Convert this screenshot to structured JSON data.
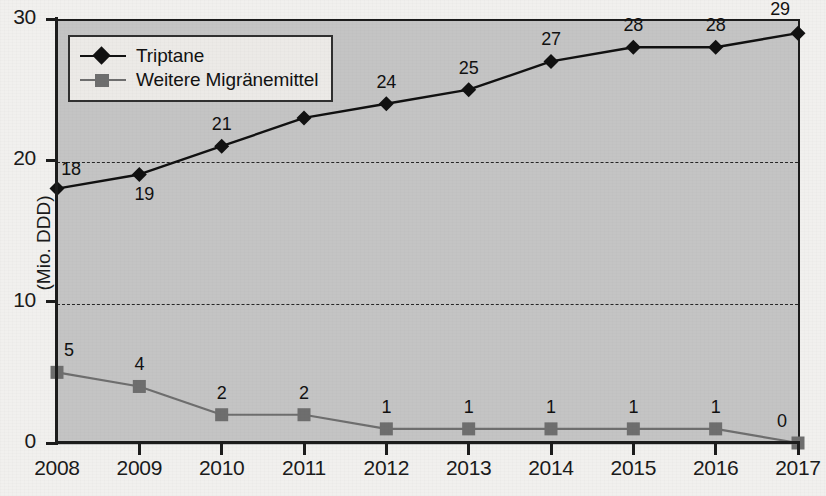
{
  "chart_data": {
    "type": "line",
    "title": "",
    "xlabel": "",
    "ylabel": "(Mio. DDD)",
    "categories": [
      "2008",
      "2009",
      "2010",
      "2011",
      "2012",
      "2013",
      "2014",
      "2015",
      "2016",
      "2017"
    ],
    "ylim": [
      0,
      30
    ],
    "yticks": [
      0,
      10,
      20,
      30
    ],
    "ytick_labels": [
      "0",
      "10",
      "20",
      "30"
    ],
    "grid": "horizontal-dashed-at-10-and-20",
    "legend_position": "top-left-inside",
    "series": [
      {
        "name": "Triptane",
        "marker": "diamond",
        "color": "#111111",
        "values": [
          18,
          19,
          21,
          23,
          24,
          25,
          27,
          28,
          28,
          29
        ],
        "labels": [
          "18",
          "19",
          "21",
          "23",
          "24",
          "25",
          "27",
          "28",
          "28",
          "29"
        ]
      },
      {
        "name": "Weitere Migränemittel",
        "marker": "square",
        "color": "#6e6e6e",
        "values": [
          5,
          4,
          2,
          2,
          1,
          1,
          1,
          1,
          1,
          0
        ],
        "labels": [
          "5",
          "4",
          "2",
          "2",
          "1",
          "1",
          "1",
          "1",
          "1",
          "0"
        ]
      }
    ]
  },
  "legend": {
    "entries": [
      {
        "label": "Triptane"
      },
      {
        "label": "Weitere Migränemittel"
      }
    ]
  },
  "axes": {
    "y_title": "(Mio. DDD)"
  }
}
